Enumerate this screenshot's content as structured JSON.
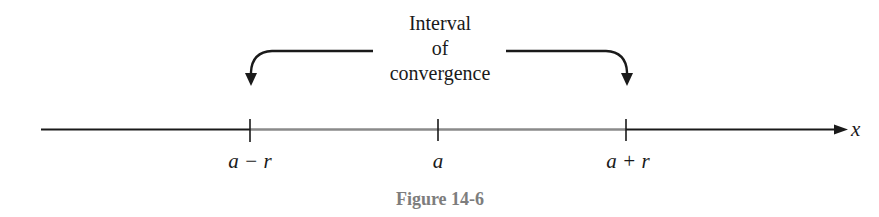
{
  "diagram": {
    "type": "number-line",
    "annotation": {
      "lines": [
        "Interval",
        "of",
        "convergence"
      ]
    },
    "axis": {
      "label": "x",
      "ticks": [
        {
          "label": "a − r",
          "x": 250
        },
        {
          "label": "a",
          "x": 438
        },
        {
          "label": "a + r",
          "x": 626
        }
      ],
      "interval_highlight": {
        "from": "a − r",
        "to": "a + r"
      }
    },
    "caption": "Figure 14-6",
    "colors": {
      "ink": "#1a1a1a",
      "interval_shade": "#8a8a8a",
      "caption": "#7d7d7d"
    }
  }
}
